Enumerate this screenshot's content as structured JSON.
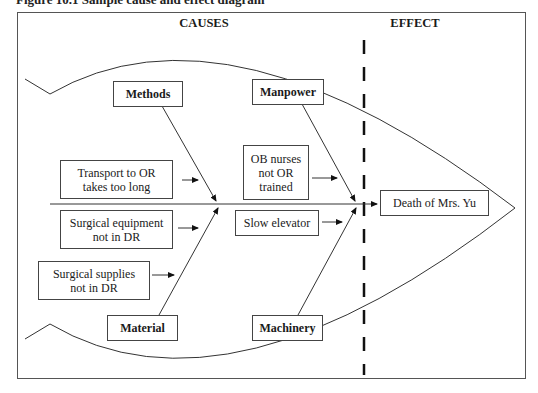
{
  "caption": "Figure 10.1   Sample cause and effect diagram",
  "headers": {
    "causes": "CAUSES",
    "effect": "EFFECT"
  },
  "categories": {
    "methods": "Methods",
    "manpower": "Manpower",
    "material": "Material",
    "machinery": "Machinery"
  },
  "causes": {
    "transport": "Transport to OR takes too long",
    "surgical_equipment": "Surgical equipment not in DR",
    "surgical_supplies": "Surgical supplies not in DR",
    "ob_nurses": "OB nurses not OR trained",
    "slow_elevator": "Slow elevator"
  },
  "effect": "Death of Mrs. Yu",
  "colors": {
    "line": "#333333",
    "dash": "#111111",
    "background": "#ffffff"
  }
}
